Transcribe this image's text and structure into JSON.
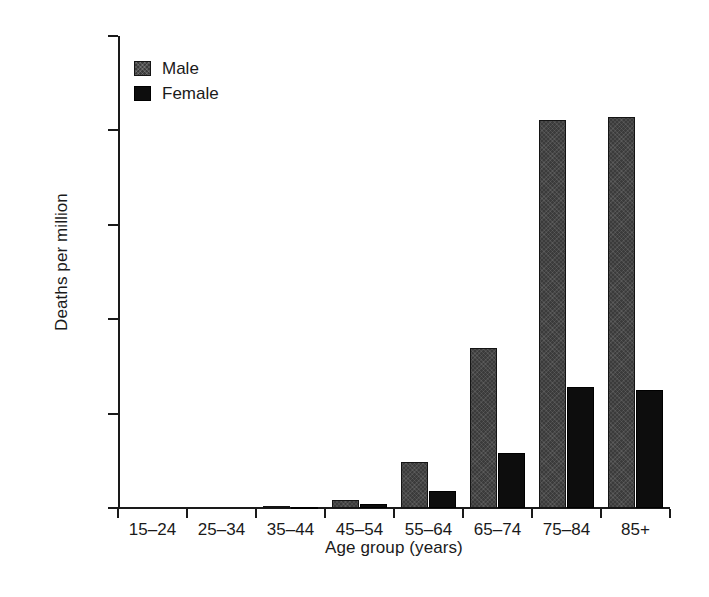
{
  "chart_data": {
    "type": "bar",
    "title": "",
    "subtitle": "",
    "xlabel": "Age group (years)",
    "ylabel": "Deaths per million",
    "categories": [
      "15–24",
      "25–34",
      "35–44",
      "45–54",
      "55–64",
      "65–74",
      "75–84",
      "85+"
    ],
    "series": [
      {
        "name": "Male",
        "color": "#3b3b3b",
        "values": [
          0,
          0,
          10,
          45,
          245,
          845,
          2055,
          2070
        ]
      },
      {
        "name": "Female",
        "color": "#0d0d0d",
        "values": [
          0,
          0,
          5,
          20,
          90,
          290,
          640,
          625
        ]
      }
    ],
    "ylim": [
      0,
      2500
    ],
    "yticks": [
      0,
      500,
      1000,
      1500,
      2000,
      2500
    ],
    "ytick_labels": [
      "0",
      "500",
      "1000",
      "1500",
      "2000",
      "2500"
    ],
    "grid": false,
    "legend": {
      "position": "top-left-inside",
      "entries": [
        "Male",
        "Female"
      ]
    }
  }
}
